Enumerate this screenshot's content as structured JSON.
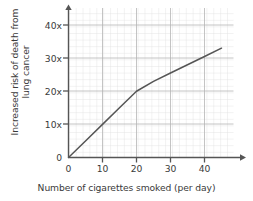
{
  "chart_data": {
    "type": "line",
    "title": "",
    "xlabel": "Number of cigarettes smoked (per day)",
    "ylabel_line1": "Increased risk of death from",
    "ylabel_line2": "lung cancer",
    "xlim": [
      0,
      48
    ],
    "ylim": [
      0,
      44
    ],
    "xticks": [
      0,
      10,
      20,
      30,
      40
    ],
    "xticklabels": [
      "0",
      "10",
      "20",
      "30",
      "40"
    ],
    "yticks": [
      0,
      10,
      20,
      30,
      40
    ],
    "yticklabels": [
      "0",
      "10x",
      "20x",
      "30x",
      "40x"
    ],
    "grid": true,
    "grid_major_step_x": 10,
    "grid_major_step_y": 10,
    "grid_minor_step_x": 2,
    "grid_minor_step_y": 2,
    "legend": "none",
    "x": [
      0,
      5,
      10,
      15,
      20,
      25,
      30,
      35,
      40,
      45
    ],
    "y": [
      0,
      5,
      10,
      15,
      20,
      23,
      25.5,
      28,
      30.5,
      33
    ],
    "series_name": "Increased risk of death from lung cancer",
    "line_color": "#555555",
    "grid_minor_color": "#dddddd",
    "grid_major_color": "#b9b9b9",
    "axis_color": "#555555",
    "text_color": "#3a3a3a"
  },
  "axes": {
    "y_title_line1": "Increased risk of death from",
    "y_title_line2": "lung cancer",
    "x_title": "Number of cigarettes smoked (per day)"
  }
}
